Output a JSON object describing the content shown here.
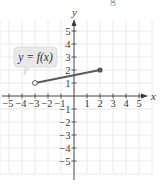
{
  "chart_data": {
    "type": "line",
    "title": "",
    "xlabel": "x",
    "ylabel": "y",
    "xlim": [
      -5.7,
      6
    ],
    "ylim": [
      -6,
      6
    ],
    "grid": true,
    "x_ticks": [
      -5,
      -4,
      -3,
      -2,
      -1,
      1,
      2,
      3,
      4,
      5
    ],
    "y_ticks": [
      -5,
      -4,
      -3,
      -2,
      -1,
      1,
      2,
      3,
      4,
      5
    ],
    "x_tick_labels": [
      "−5",
      "−4",
      "−3",
      "−2",
      "−1",
      "1",
      "2",
      "3",
      "4",
      "5"
    ],
    "y_tick_labels": [
      "−5",
      "−4",
      "−3",
      "−2",
      "−1",
      "1",
      "2",
      "3",
      "4",
      "5"
    ],
    "series": [
      {
        "name": "y = f(x)",
        "points": [
          {
            "x": -3,
            "y": 1,
            "marker": "open"
          },
          {
            "x": 2,
            "y": 2,
            "marker": "closed"
          }
        ],
        "color": "#5a5a5a"
      }
    ],
    "annotations": [
      {
        "text": "y = f(x)",
        "points_to": {
          "x": -3,
          "y": 1
        },
        "style": "callout"
      }
    ]
  },
  "labels": {
    "x_axis": "x",
    "y_axis": "y",
    "callout": "y = f(x)",
    "top_fragment": "g"
  },
  "colors": {
    "grid": "#e4e4e4",
    "axis": "#3a3a3a",
    "segment": "#5a5a5a",
    "callout_fill": "#e9e9e9",
    "callout_stroke": "#d6d6d6"
  }
}
